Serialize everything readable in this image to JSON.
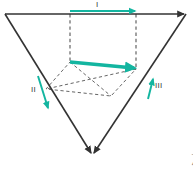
{
  "figure": {
    "title": "",
    "background_color": "#ffffff",
    "stroke_color": "#333333",
    "dashed_color": "#555555",
    "accent_color": "#13b5a0",
    "labels": {
      "vector_one": "I",
      "vector_two": "II",
      "vector_three": "III"
    },
    "corner_caption": "中 专",
    "shape": {
      "kind": "inverted-triangle",
      "apex_bottom": [
        92,
        155
      ],
      "top_left": [
        5,
        14
      ],
      "top_right": [
        186,
        14
      ]
    },
    "arrows": [
      {
        "name": "top-arrow",
        "label": "I",
        "from": [
          70,
          11
        ],
        "to": [
          136,
          11
        ],
        "direction": "right",
        "color": "#13b5a0"
      },
      {
        "name": "center-arrow",
        "label": "",
        "from": [
          70,
          62
        ],
        "to": [
          136,
          69
        ],
        "direction": "right-down",
        "color": "#13b5a0"
      },
      {
        "name": "left-arrow",
        "label": "II",
        "from": [
          38,
          76
        ],
        "to": [
          49,
          110
        ],
        "direction": "down-right",
        "color": "#13b5a0"
      },
      {
        "name": "right-arrow",
        "label": "III",
        "from": [
          148,
          99
        ],
        "to": [
          154,
          77
        ],
        "direction": "up-right",
        "color": "#13b5a0"
      }
    ]
  }
}
